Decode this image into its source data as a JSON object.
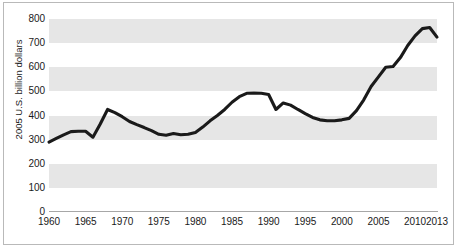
{
  "chart_data": {
    "type": "line",
    "title": "",
    "xlabel": "",
    "ylabel": "2005 U.S. billion dollars",
    "xlim": [
      1960,
      2013
    ],
    "ylim": [
      0,
      800
    ],
    "ytick_values": [
      0,
      100,
      200,
      300,
      400,
      500,
      600,
      700,
      800
    ],
    "ytick_labels": [
      "0",
      "100",
      "200",
      "300",
      "400",
      "500",
      "600",
      "700",
      "800"
    ],
    "xtick_values": [
      1960,
      1965,
      1970,
      1975,
      1980,
      1985,
      1990,
      1995,
      2000,
      2005,
      2010,
      2013
    ],
    "xtick_labels": [
      "1960",
      "1965",
      "1970",
      "1975",
      "1980",
      "1985",
      "1990",
      "1995",
      "2000",
      "2005",
      "2010",
      "2013"
    ],
    "grid": false,
    "banding": true,
    "band_ranges": [
      [
        100,
        200
      ],
      [
        300,
        400
      ],
      [
        500,
        600
      ],
      [
        700,
        800
      ]
    ],
    "band_color": "#e6e6e6",
    "line_color": "#1a1a1a",
    "legend": null,
    "series": [
      {
        "name": "2005 U.S. billion dollars",
        "x": [
          1960,
          1961,
          1962,
          1963,
          1964,
          1965,
          1966,
          1967,
          1968,
          1969,
          1970,
          1971,
          1972,
          1973,
          1974,
          1975,
          1976,
          1977,
          1978,
          1979,
          1980,
          1981,
          1982,
          1983,
          1984,
          1985,
          1986,
          1987,
          1988,
          1989,
          1990,
          1991,
          1992,
          1993,
          1994,
          1995,
          1996,
          1997,
          1998,
          1999,
          2000,
          2001,
          2002,
          2003,
          2004,
          2005,
          2006,
          2007,
          2008,
          2009,
          2010,
          2011,
          2012,
          2013
        ],
        "values": [
          290,
          305,
          320,
          333,
          335,
          335,
          310,
          365,
          425,
          412,
          395,
          375,
          362,
          350,
          337,
          322,
          318,
          325,
          320,
          322,
          330,
          352,
          378,
          400,
          425,
          455,
          478,
          492,
          493,
          492,
          487,
          425,
          452,
          443,
          425,
          408,
          392,
          382,
          378,
          378,
          382,
          388,
          420,
          465,
          520,
          560,
          600,
          603,
          640,
          690,
          730,
          760,
          765,
          725
        ]
      }
    ]
  },
  "axis": {
    "y_title": "2005 U.S. billion dollars"
  }
}
